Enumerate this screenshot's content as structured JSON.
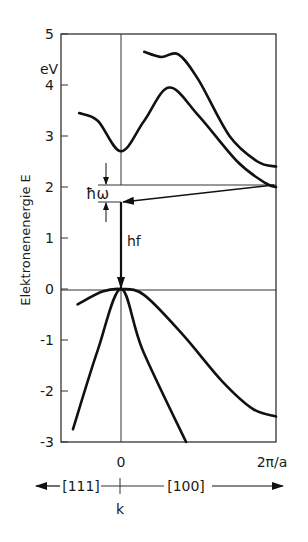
{
  "diagram": {
    "type": "band-structure",
    "y_axis": {
      "title": "Elektronenenergie E",
      "unit": "eV",
      "range": [
        -3,
        5
      ],
      "ticks": [
        {
          "value": 5,
          "label": "5"
        },
        {
          "value": 4,
          "label": "4"
        },
        {
          "value": 3,
          "label": "3"
        },
        {
          "value": 2,
          "label": "2"
        },
        {
          "value": 1,
          "label": "1"
        },
        {
          "value": 0,
          "label": "0"
        },
        {
          "value": -1,
          "label": "-1"
        },
        {
          "value": -2,
          "label": "-2"
        },
        {
          "value": -3,
          "label": "-3"
        }
      ]
    },
    "x_axis": {
      "title": "k",
      "tick_zero": "0",
      "tick_end": "2π/a",
      "direction_left": "[111]",
      "direction_right": "[100]",
      "range_note": "k from [111] (left of 0) to [100] up to 2π/a"
    },
    "annotations": {
      "phonon_label": "ħω",
      "photon_label": "hf"
    },
    "levels": {
      "conduction_min_indirect_eV": 2.0,
      "virtual_state_eV": 1.67,
      "valence_max_eV": 0.0,
      "conduction_min_at_gamma_eV": 2.7
    },
    "bands": [
      {
        "name": "conduction-band-upper",
        "points_k_E": [
          [
            0.15,
            4.65
          ],
          [
            0.26,
            4.55
          ],
          [
            0.37,
            4.6
          ],
          [
            0.5,
            4.1
          ],
          [
            0.7,
            3.0
          ],
          [
            0.88,
            2.5
          ],
          [
            1.0,
            2.4
          ]
        ]
      },
      {
        "name": "conduction-band-lower",
        "points_k_E": [
          [
            -0.27,
            3.45
          ],
          [
            -0.15,
            3.3
          ],
          [
            0.0,
            2.7
          ],
          [
            0.15,
            3.3
          ],
          [
            0.31,
            3.95
          ],
          [
            0.5,
            3.4
          ],
          [
            0.75,
            2.5
          ],
          [
            0.93,
            2.08
          ],
          [
            1.0,
            2.0
          ]
        ]
      },
      {
        "name": "valence-band-heavy",
        "points_k_E": [
          [
            -0.28,
            -0.3
          ],
          [
            -0.12,
            -0.05
          ],
          [
            0.0,
            0.0
          ],
          [
            0.15,
            -0.12
          ],
          [
            0.4,
            -0.9
          ],
          [
            0.65,
            -1.8
          ],
          [
            0.85,
            -2.35
          ],
          [
            1.0,
            -2.5
          ]
        ]
      },
      {
        "name": "valence-band-light",
        "points_k_E": [
          [
            -0.31,
            -2.75
          ],
          [
            -0.15,
            -1.2
          ],
          [
            0.0,
            0.0
          ],
          [
            0.14,
            -1.2
          ],
          [
            0.42,
            -3.0
          ]
        ]
      }
    ]
  }
}
